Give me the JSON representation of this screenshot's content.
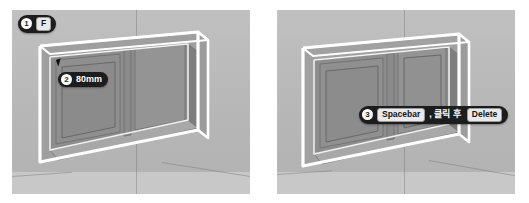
{
  "figure": {
    "background_color": "#ffffff",
    "viewport_color": "#bcbcbc"
  },
  "panels": [
    {
      "id": "panel-left",
      "name": "offset-step-panel",
      "badges": [
        {
          "id": "badge-step1",
          "step": "1",
          "keys": [
            "F"
          ],
          "text": "",
          "full_label": "1 F"
        },
        {
          "id": "badge-step2",
          "step": "2",
          "keys": [],
          "text": "80mm",
          "full_label": "2 80mm"
        }
      ],
      "dimension_value": "80mm"
    },
    {
      "id": "panel-right",
      "name": "delete-step-panel",
      "badges": [
        {
          "id": "badge-step3",
          "step": "3",
          "keys": [
            "Spacebar",
            "Delete"
          ],
          "text": ", 클릭 후 ",
          "full_label": "3 Spacebar , 클릭 후 Delete"
        }
      ]
    }
  ],
  "labels": {
    "step1_number": "1",
    "step1_key": "F",
    "step2_number": "2",
    "step2_value": "80mm",
    "step3_number": "3",
    "step3_key_first": "Spacebar",
    "step3_middle_text": ", 클릭 후",
    "step3_key_last": "Delete"
  },
  "colors": {
    "badge_background": "#1d1d1d",
    "badge_text": "#ffffff",
    "keycap_background": "#e9e9e9",
    "keycap_text": "#141414",
    "wall": "#bcbcbc",
    "frame_highlight": "#ffffff",
    "frame_face": "#8e8e8e",
    "frame_shadow": "#6f6f6f",
    "glass_face": "#9a9a9a",
    "floor": "#c8c8c8"
  }
}
